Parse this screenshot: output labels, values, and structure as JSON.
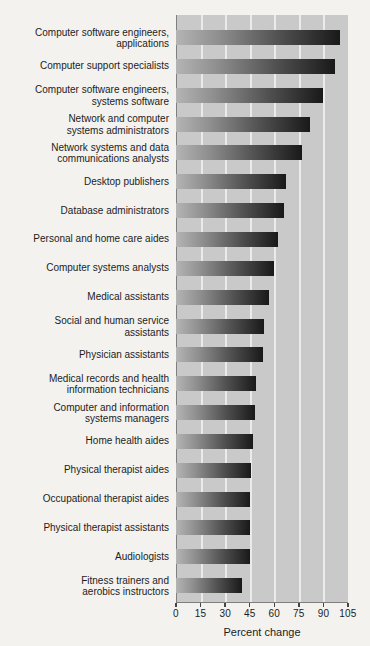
{
  "chart_data": {
    "type": "bar",
    "orientation": "horizontal",
    "xlabel": "Percent change",
    "xlim": [
      0,
      105
    ],
    "x_ticks": [
      0,
      15,
      30,
      45,
      60,
      75,
      90,
      105
    ],
    "grid": "vertical white gridlines at each 15-unit tick",
    "legend": "none",
    "categories": [
      "Computer software engineers,\napplications",
      "Computer support specialists",
      "Computer software engineers,\nsystems software",
      "Network and computer\nsystems administrators",
      "Network systems and data\ncommunications analysts",
      "Desktop publishers",
      "Database administrators",
      "Personal and home care aides",
      "Computer systems analysts",
      "Medical assistants",
      "Social and human service\nassistants",
      "Physician assistants",
      "Medical records and health\ninformation technicians",
      "Computer and information\nsystems managers",
      "Home health aides",
      "Physical therapist aides",
      "Occupational therapist aides",
      "Physical therapist assistants",
      "Audiologists",
      "Fitness trainers and\naerobics instructors"
    ],
    "values": [
      100,
      97,
      90,
      82,
      77,
      67,
      66,
      62,
      60,
      57,
      54,
      53,
      49,
      48,
      47,
      46,
      45,
      45,
      45,
      40
    ]
  },
  "colors": {
    "page_background": "#f3f2ef",
    "plot_background": "#c9c9c9",
    "gridline": "#ebebeb",
    "axis_line": "#7f7f7f",
    "tick": "#454545",
    "text": "#1c1c1c",
    "bar_gradient_start": "#b4b4b4",
    "bar_gradient_end": "#191919"
  }
}
